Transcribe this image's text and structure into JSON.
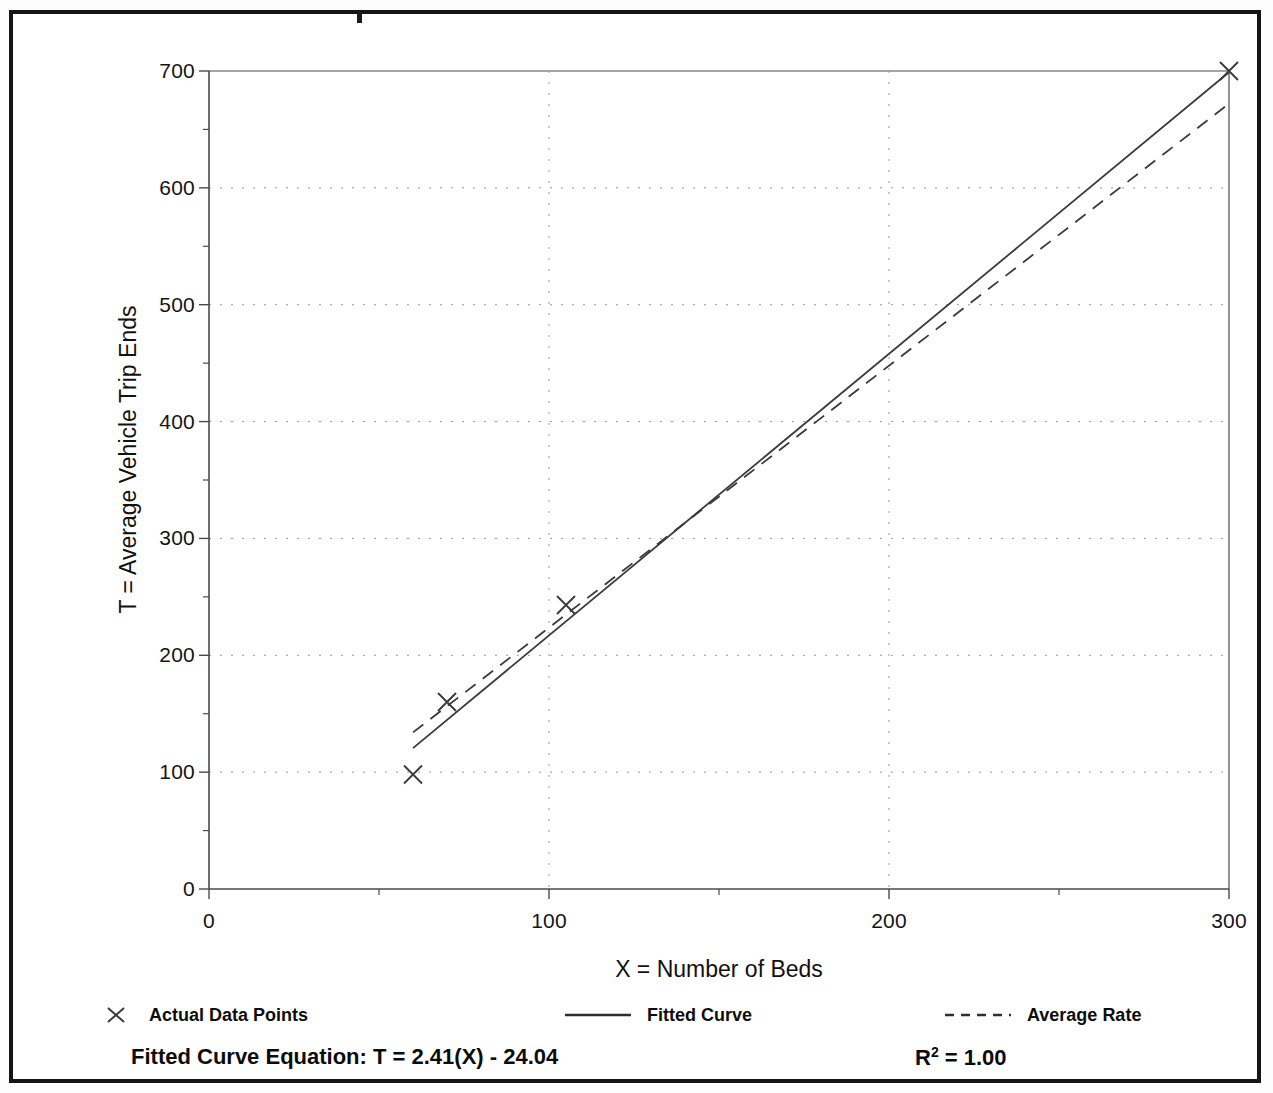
{
  "figure": {
    "background_color": "#ffffff",
    "frame_color": "#151515",
    "axis_color": "#4a4a4a",
    "grid_color": "#9a9a9a",
    "series_color": "#3b3b3b"
  },
  "chart_data": {
    "type": "scatter",
    "title": "",
    "xlabel": "X = Number of Beds",
    "ylabel": "T = Average Vehicle Trip Ends",
    "xlim": [
      0,
      300
    ],
    "ylim": [
      0,
      700
    ],
    "xticks": [
      0,
      100,
      200,
      300
    ],
    "xtick_labels": [
      "0",
      "100",
      "200",
      "300"
    ],
    "xminor_ticks": [
      50,
      150,
      250
    ],
    "yticks": [
      0,
      100,
      200,
      300,
      400,
      500,
      600,
      700
    ],
    "ytick_labels": [
      "0",
      "100",
      "200",
      "300",
      "400",
      "500",
      "600",
      "700"
    ],
    "yminor_ticks": [
      50,
      150,
      250,
      350,
      450,
      550,
      650
    ],
    "grid": true,
    "grid_style": "dotted",
    "legend_position": "below-axes",
    "series": [
      {
        "name": "Actual Data Points",
        "type": "scatter",
        "marker": "x",
        "points": [
          {
            "x": 60,
            "y": 98
          },
          {
            "x": 70,
            "y": 160
          },
          {
            "x": 105,
            "y": 243
          },
          {
            "x": 300,
            "y": 700
          }
        ]
      },
      {
        "name": "Fitted Curve",
        "type": "line",
        "style": "solid",
        "equation": "T = 2.41(X) - 24.04",
        "x_range": [
          60,
          300
        ],
        "points": [
          {
            "x": 60,
            "y": 120.6
          },
          {
            "x": 300,
            "y": 698.96
          }
        ]
      },
      {
        "name": "Average Rate",
        "type": "line",
        "style": "dashed",
        "x_range": [
          60,
          300
        ],
        "points": [
          {
            "x": 60,
            "y": 134
          },
          {
            "x": 300,
            "y": 672
          }
        ]
      }
    ]
  },
  "axes": {
    "y_title": "T = Average Vehicle Trip Ends",
    "x_title": "X = Number of Beds"
  },
  "legend": {
    "items": [
      {
        "label": "Actual Data Points",
        "marker": "x-marker-icon"
      },
      {
        "label": "Fitted Curve",
        "marker": "solid-line-icon"
      },
      {
        "label": "Average Rate",
        "marker": "dashed-line-icon"
      }
    ]
  },
  "footer": {
    "equation_label": "Fitted Curve Equation:",
    "equation_value": "T = 2.41(X) - 24.04",
    "equation_full": "Fitted Curve Equation:  T = 2.41(X) - 24.04",
    "r_squared_label": "R",
    "r_squared_exponent": "2",
    "r_squared_value": " = 1.00"
  }
}
